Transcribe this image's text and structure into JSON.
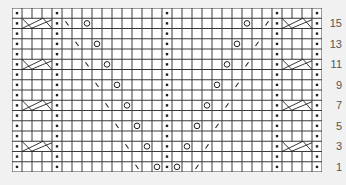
{
  "chart": {
    "title": "",
    "columns": 31,
    "rows": 16,
    "cell_width": 10,
    "cell_height": 10.25,
    "colors": {
      "grid_line": "#3a3a3a",
      "symbol": "#222222",
      "background": "#ffffff",
      "page_background": "#f1f1f1",
      "label": "#555555"
    },
    "purl_columns": [
      0,
      4,
      15,
      26,
      30
    ],
    "cables": [
      {
        "row": 3,
        "start_col": 1,
        "width": 3
      },
      {
        "row": 7,
        "start_col": 1,
        "width": 3
      },
      {
        "row": 11,
        "start_col": 1,
        "width": 3
      },
      {
        "row": 15,
        "start_col": 1,
        "width": 3
      },
      {
        "row": 3,
        "start_col": 27,
        "width": 3
      },
      {
        "row": 7,
        "start_col": 27,
        "width": 3
      },
      {
        "row": 11,
        "start_col": 27,
        "width": 3
      },
      {
        "row": 15,
        "start_col": 27,
        "width": 3
      }
    ],
    "symbols": [
      {
        "row": 1,
        "col": 12,
        "type": "ssk"
      },
      {
        "row": 1,
        "col": 14,
        "type": "yo"
      },
      {
        "row": 1,
        "col": 16,
        "type": "yo"
      },
      {
        "row": 1,
        "col": 18,
        "type": "k2tog"
      },
      {
        "row": 3,
        "col": 11,
        "type": "ssk"
      },
      {
        "row": 3,
        "col": 13,
        "type": "yo"
      },
      {
        "row": 3,
        "col": 17,
        "type": "yo"
      },
      {
        "row": 3,
        "col": 19,
        "type": "k2tog"
      },
      {
        "row": 5,
        "col": 10,
        "type": "ssk"
      },
      {
        "row": 5,
        "col": 12,
        "type": "yo"
      },
      {
        "row": 5,
        "col": 18,
        "type": "yo"
      },
      {
        "row": 5,
        "col": 20,
        "type": "k2tog"
      },
      {
        "row": 7,
        "col": 9,
        "type": "ssk"
      },
      {
        "row": 7,
        "col": 11,
        "type": "yo"
      },
      {
        "row": 7,
        "col": 19,
        "type": "yo"
      },
      {
        "row": 7,
        "col": 21,
        "type": "k2tog"
      },
      {
        "row": 9,
        "col": 8,
        "type": "ssk"
      },
      {
        "row": 9,
        "col": 10,
        "type": "yo"
      },
      {
        "row": 9,
        "col": 20,
        "type": "yo"
      },
      {
        "row": 9,
        "col": 22,
        "type": "k2tog"
      },
      {
        "row": 11,
        "col": 7,
        "type": "ssk"
      },
      {
        "row": 11,
        "col": 9,
        "type": "yo"
      },
      {
        "row": 11,
        "col": 21,
        "type": "yo"
      },
      {
        "row": 11,
        "col": 23,
        "type": "k2tog"
      },
      {
        "row": 13,
        "col": 6,
        "type": "ssk"
      },
      {
        "row": 13,
        "col": 8,
        "type": "yo"
      },
      {
        "row": 13,
        "col": 22,
        "type": "yo"
      },
      {
        "row": 13,
        "col": 24,
        "type": "k2tog"
      },
      {
        "row": 15,
        "col": 5,
        "type": "ssk"
      },
      {
        "row": 15,
        "col": 7,
        "type": "yo"
      },
      {
        "row": 15,
        "col": 23,
        "type": "yo"
      },
      {
        "row": 15,
        "col": 25,
        "type": "k2tog"
      }
    ],
    "symbol_legend": {
      "dot": "purl",
      "ssk": "backslash",
      "k2tog": "slash",
      "yo": "circle",
      "cable": "crossed cable"
    }
  },
  "row_labels": [
    {
      "row": 15,
      "text": "15"
    },
    {
      "row": 13,
      "text": "13"
    },
    {
      "row": 11,
      "text": "11"
    },
    {
      "row": 9,
      "text": "9"
    },
    {
      "row": 7,
      "text": "7"
    },
    {
      "row": 5,
      "text": "5"
    },
    {
      "row": 3,
      "text": "3"
    },
    {
      "row": 1,
      "text": "1"
    }
  ]
}
